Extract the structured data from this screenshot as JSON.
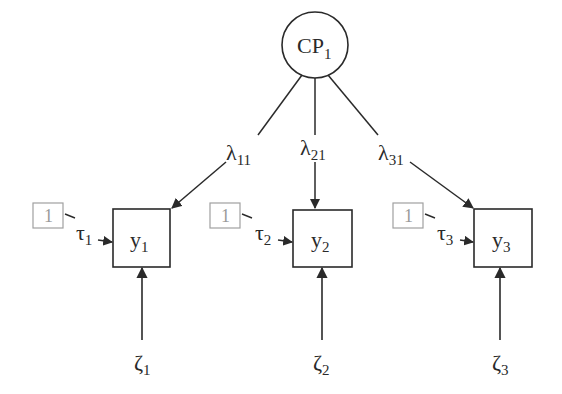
{
  "diagram": {
    "type": "structural-equation-model",
    "latent": {
      "id": "CP1",
      "label": "CP",
      "subscript": "1"
    },
    "indicators": [
      {
        "id": "y1",
        "label": "y",
        "subscript": "1",
        "loading": "λ",
        "loading_sub": "11",
        "intercept": "τ",
        "intercept_sub": "1",
        "residual": "ζ",
        "residual_sub": "1",
        "constant": "1"
      },
      {
        "id": "y2",
        "label": "y",
        "subscript": "2",
        "loading": "λ",
        "loading_sub": "21",
        "intercept": "τ",
        "intercept_sub": "2",
        "residual": "ζ",
        "residual_sub": "2",
        "constant": "1"
      },
      {
        "id": "y3",
        "label": "y",
        "subscript": "3",
        "loading": "λ",
        "loading_sub": "31",
        "intercept": "τ",
        "intercept_sub": "3",
        "residual": "ζ",
        "residual_sub": "3",
        "constant": "1"
      }
    ]
  },
  "colors": {
    "line": "#2a2a2a",
    "constant_box": "#a0a0a0",
    "background": "#ffffff"
  }
}
